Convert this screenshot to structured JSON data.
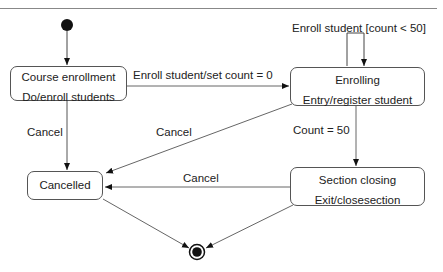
{
  "diagram": {
    "type": "UML state machine",
    "states": [
      {
        "id": "course_enrollment",
        "name": "Course enrollment",
        "action": "Do/enroll students"
      },
      {
        "id": "enrolling",
        "name": "Enrolling",
        "action": "Entry/register student"
      },
      {
        "id": "section_closing",
        "name": "Section closing",
        "action": "Exit/closesection"
      },
      {
        "id": "cancelled",
        "name": "Cancelled"
      }
    ],
    "pseudo_states": {
      "initial": "initial-state",
      "final": "final-state"
    },
    "transitions": [
      {
        "from": "initial",
        "to": "course_enrollment",
        "label": ""
      },
      {
        "from": "course_enrollment",
        "to": "enrolling",
        "label": "Enroll student/set count = 0"
      },
      {
        "from": "enrolling",
        "to": "enrolling",
        "label": "Enroll student [count < 50]"
      },
      {
        "from": "enrolling",
        "to": "section_closing",
        "label": "Count = 50"
      },
      {
        "from": "course_enrollment",
        "to": "cancelled",
        "label": "Cancel"
      },
      {
        "from": "enrolling",
        "to": "cancelled",
        "label": "Cancel"
      },
      {
        "from": "section_closing",
        "to": "cancelled",
        "label": "Cancel"
      },
      {
        "from": "cancelled",
        "to": "final",
        "label": ""
      },
      {
        "from": "section_closing",
        "to": "final",
        "label": ""
      }
    ]
  },
  "labels": {
    "course_enrollment_name": "Course enrollment",
    "course_enrollment_action": "Do/enroll students",
    "enrolling_name": "Enrolling",
    "enrolling_action": "Entry/register student",
    "section_closing_name": "Section closing",
    "section_closing_action": "Exit/closesection",
    "cancelled_name": "Cancelled",
    "t_enroll_set_count": "Enroll student/set count = 0",
    "t_self_loop": "Enroll student [count < 50]",
    "t_count_50": "Count = 50",
    "t_cancel_1": "Cancel",
    "t_cancel_2": "Cancel",
    "t_cancel_3": "Cancel"
  }
}
